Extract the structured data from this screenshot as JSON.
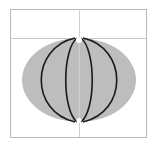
{
  "diagram": {
    "type": "globe-meridians",
    "frame": {
      "x": 10,
      "y": 9,
      "width": 136,
      "height": 128,
      "stroke": "#b8b8b8"
    },
    "guides": {
      "horizontal_y": 38,
      "vertical_x": 79,
      "color": "#c8c8c8"
    },
    "ellipse": {
      "cx": 79,
      "cy": 80,
      "rx": 57,
      "ry": 42,
      "fill": "#bdbdbd"
    },
    "meridians": {
      "top": [
        79,
        38
      ],
      "bottom": [
        79,
        122
      ],
      "half_widths": [
        39,
        13
      ],
      "stroke": "#1a1a1a"
    }
  }
}
